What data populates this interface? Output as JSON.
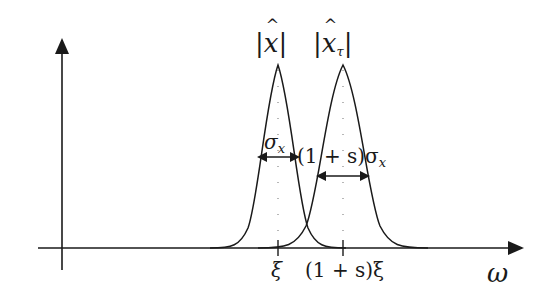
{
  "diagram": {
    "type": "two gaussian pulses on frequency axis",
    "colors": {
      "line": "#1a1a1a",
      "dots": "#888888",
      "background": "#ffffff"
    },
    "axes": {
      "x_label": "ω",
      "y_label": ""
    },
    "curves": [
      {
        "name": "|x̂|",
        "label_base": "x",
        "label_subscript": "",
        "center_label": "ξ",
        "width_label": "σ",
        "width_subscript": "x"
      },
      {
        "name": "|x̂_τ|",
        "label_base": "x",
        "label_subscript": "τ",
        "center_label": "(1 + s)ξ",
        "width_label": "(1 + s)σ",
        "width_subscript": "x"
      }
    ],
    "bar": "|"
  }
}
